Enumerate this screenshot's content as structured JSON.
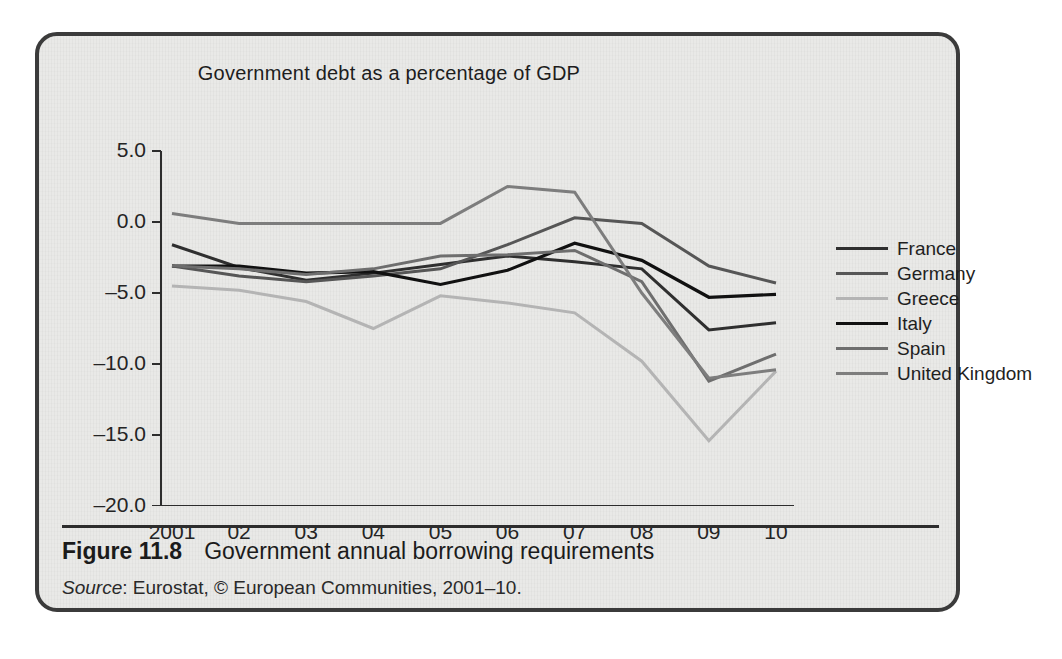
{
  "figure": {
    "number_label": "Figure 11.8",
    "caption": "Government annual borrowing requirements",
    "source_prefix": "Source",
    "source_text": ": Eurostat, © European Communities, 2001–10."
  },
  "chart_data": {
    "type": "line",
    "title": "Government debt as a percentage of GDP",
    "xlabel": "",
    "ylabel": "",
    "grid": false,
    "legend_position": "right",
    "ylim": [
      -20.0,
      5.0
    ],
    "yticks": [
      5.0,
      0.0,
      -5.0,
      -10.0,
      -15.0,
      -20.0
    ],
    "ytick_labels": [
      "5.0",
      "0.0",
      "-5.0",
      "-10.0",
      "-15.0",
      "-20.0"
    ],
    "x": [
      2001,
      2002,
      2003,
      2004,
      2005,
      2006,
      2007,
      2008,
      2009,
      2010
    ],
    "xtick_labels": [
      "2001",
      "02",
      "03",
      "04",
      "05",
      "06",
      "07",
      "08",
      "09",
      "10"
    ],
    "series": [
      {
        "name": "France",
        "color": "#2f2f2f",
        "width": 3.0,
        "values": [
          -1.6,
          -3.2,
          -4.1,
          -3.6,
          -3.0,
          -2.4,
          -2.8,
          -3.3,
          -7.6,
          -7.1
        ]
      },
      {
        "name": "Germany",
        "color": "#565656",
        "width": 3.0,
        "values": [
          -3.1,
          -3.8,
          -4.2,
          -3.8,
          -3.3,
          -1.6,
          0.3,
          -0.1,
          -3.1,
          -4.3
        ]
      },
      {
        "name": "Greece",
        "color": "#b4b4b4",
        "width": 3.0,
        "values": [
          -4.5,
          -4.8,
          -5.6,
          -7.5,
          -5.2,
          -5.7,
          -6.4,
          -9.8,
          -15.4,
          -10.5
        ]
      },
      {
        "name": "Italy",
        "color": "#111111",
        "width": 3.2,
        "values": [
          -3.1,
          -3.1,
          -3.6,
          -3.5,
          -4.4,
          -3.4,
          -1.5,
          -2.7,
          -5.3,
          -5.1
        ]
      },
      {
        "name": "Spain",
        "color": "#6e6e6e",
        "width": 3.0,
        "values": [
          -3.1,
          -3.3,
          -3.7,
          -3.3,
          -2.4,
          -2.3,
          -2.0,
          -4.2,
          -11.2,
          -9.3
        ]
      },
      {
        "name": "United Kingdom",
        "color": "#7d7d7d",
        "width": 3.0,
        "values": [
          0.6,
          -0.1,
          -0.1,
          -0.1,
          -0.1,
          2.5,
          2.1,
          -5.0,
          -11.0,
          -10.4
        ]
      }
    ]
  },
  "colors": {
    "panel_background": "#e9e9e7",
    "panel_border": "#3b3b3b",
    "axis": "#2d2d2d",
    "text": "#1d1d1d",
    "page_background": "#ffffff"
  }
}
